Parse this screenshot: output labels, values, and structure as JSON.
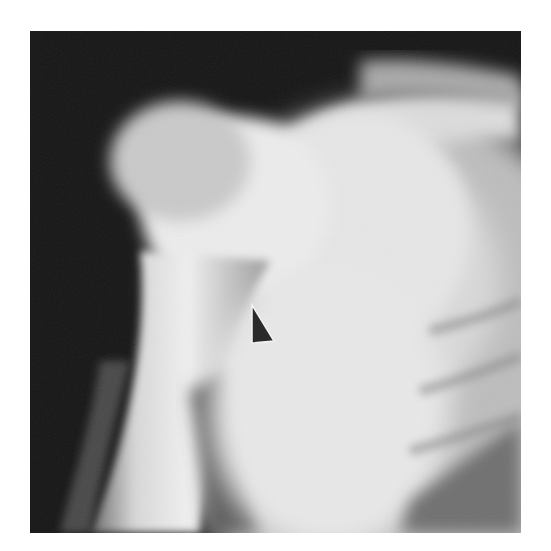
{
  "figure": {
    "type": "radiograph",
    "marker": {
      "shape": "arrowhead",
      "color": "#2a2a2a",
      "direction": "pointing up-left"
    }
  }
}
